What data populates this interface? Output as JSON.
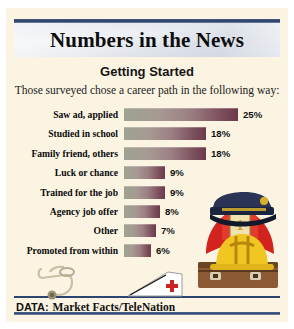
{
  "masthead": {
    "title": "Numbers in the News"
  },
  "chart_header": {
    "title": "Getting Started",
    "subtitle": "Those surveyed chose a career path in the following way:"
  },
  "footer": {
    "label": "DATA:",
    "source": "Market Facts/TeleNation"
  },
  "colors": {
    "page_background": "#fbf4e2",
    "rule_blue": "#2c4470",
    "bar_start": "#9ea391",
    "bar_end": "#6b3b4b",
    "text": "#111111"
  },
  "illustration": {
    "items": [
      "police-cap",
      "fire-helmet",
      "construction-hard-hat",
      "briefcase",
      "stethoscope",
      "nurse-cap"
    ]
  },
  "chart_data": {
    "type": "bar",
    "orientation": "horizontal",
    "title": "Getting Started",
    "subtitle": "Those surveyed chose a career path in the following way:",
    "xlabel": "",
    "ylabel": "",
    "xlim": [
      0,
      25
    ],
    "grid": false,
    "legend": null,
    "value_suffix": "%",
    "source": "Market Facts/TeleNation",
    "categories": [
      "Saw ad, applied",
      "Studied in school",
      "Family friend, others",
      "Luck or chance",
      "Trained for the job",
      "Agency job offer",
      "Other",
      "Promoted from within"
    ],
    "values": [
      25,
      18,
      18,
      9,
      9,
      8,
      7,
      6
    ],
    "labels": [
      "25%",
      "18%",
      "18%",
      "9%",
      "9%",
      "8%",
      "7%",
      "6%"
    ]
  }
}
